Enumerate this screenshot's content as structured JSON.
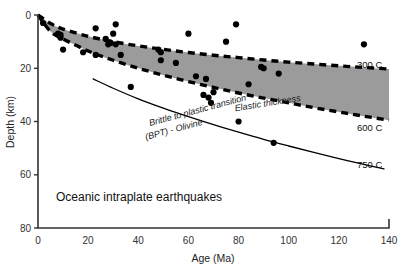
{
  "figure": {
    "caption": "Oceanic intraplate earthquakes",
    "background_color": "#ffffff",
    "band_color": "#9b9b9b",
    "axis_color": "#333333",
    "point_color": "#000000"
  },
  "axes": {
    "x_title": "Age (Ma)",
    "y_title": "Depth (km)",
    "x_ticks": [
      "0",
      "20",
      "40",
      "60",
      "80",
      "100",
      "120",
      "140"
    ],
    "y_ticks": [
      "0",
      "20",
      "40",
      "60",
      "80"
    ]
  },
  "labels": {
    "iso_300": "300 C",
    "iso_600": "600 C",
    "iso_750": "750 C",
    "band_label": "Elastic thickness",
    "bpt_line1": "Brittle to plastic transition",
    "bpt_line2": "(BPT) - Olivine"
  },
  "chart_data": {
    "type": "scatter",
    "title": "Oceanic intraplate earthquakes",
    "xlabel": "Age (Ma)",
    "ylabel": "Depth (km)",
    "xlim": [
      0,
      140
    ],
    "ylim": [
      0,
      80
    ],
    "y_inverted": true,
    "grid": false,
    "legend": "none",
    "x_ticks": [
      0,
      20,
      40,
      60,
      80,
      100,
      120,
      140
    ],
    "y_ticks": [
      0,
      20,
      40,
      60,
      80
    ],
    "points": [
      {
        "age": 2,
        "depth": 3
      },
      {
        "age": 8,
        "depth": 7
      },
      {
        "age": 9,
        "depth": 7.5
      },
      {
        "age": 9,
        "depth": 8.5
      },
      {
        "age": 10,
        "depth": 13
      },
      {
        "age": 18,
        "depth": 14
      },
      {
        "age": 23,
        "depth": 5
      },
      {
        "age": 23,
        "depth": 15
      },
      {
        "age": 27,
        "depth": 9
      },
      {
        "age": 28,
        "depth": 11
      },
      {
        "age": 29,
        "depth": 10.5
      },
      {
        "age": 30,
        "depth": 7
      },
      {
        "age": 31,
        "depth": 3.5
      },
      {
        "age": 31,
        "depth": 11
      },
      {
        "age": 33,
        "depth": 15
      },
      {
        "age": 37,
        "depth": 27
      },
      {
        "age": 48,
        "depth": 13
      },
      {
        "age": 49,
        "depth": 14
      },
      {
        "age": 49,
        "depth": 17
      },
      {
        "age": 55,
        "depth": 18
      },
      {
        "age": 60,
        "depth": 7
      },
      {
        "age": 63,
        "depth": 23
      },
      {
        "age": 66,
        "depth": 30
      },
      {
        "age": 67,
        "depth": 24
      },
      {
        "age": 68,
        "depth": 31
      },
      {
        "age": 69,
        "depth": 33
      },
      {
        "age": 70,
        "depth": 29
      },
      {
        "age": 75,
        "depth": 10
      },
      {
        "age": 79,
        "depth": 3.5
      },
      {
        "age": 80,
        "depth": 40
      },
      {
        "age": 84,
        "depth": 26
      },
      {
        "age": 89,
        "depth": 19.5
      },
      {
        "age": 90,
        "depth": 20
      },
      {
        "age": 94,
        "depth": 48
      },
      {
        "age": 96,
        "depth": 22
      },
      {
        "age": 130,
        "depth": 11
      }
    ],
    "curves": [
      {
        "name": "300 C",
        "style": "dashed",
        "points": [
          [
            0,
            0
          ],
          [
            5,
            3.2
          ],
          [
            10,
            5.3
          ],
          [
            20,
            8
          ],
          [
            30,
            10
          ],
          [
            40,
            11.6
          ],
          [
            50,
            12.9
          ],
          [
            60,
            14.1
          ],
          [
            70,
            15.1
          ],
          [
            80,
            16
          ],
          [
            90,
            16.9
          ],
          [
            100,
            17.7
          ],
          [
            110,
            18.4
          ],
          [
            120,
            19.1
          ],
          [
            130,
            19.7
          ],
          [
            140,
            20.3
          ]
        ]
      },
      {
        "name": "600 C",
        "style": "dashed",
        "points": [
          [
            0,
            0
          ],
          [
            5,
            6.2
          ],
          [
            10,
            9
          ],
          [
            20,
            13.5
          ],
          [
            30,
            17
          ],
          [
            40,
            20
          ],
          [
            50,
            22.6
          ],
          [
            60,
            25
          ],
          [
            70,
            27.2
          ],
          [
            80,
            29.3
          ],
          [
            90,
            31.2
          ],
          [
            100,
            33
          ],
          [
            110,
            34.8
          ],
          [
            120,
            36.4
          ],
          [
            130,
            38
          ],
          [
            140,
            39.5
          ]
        ]
      },
      {
        "name": "750 C",
        "style": "solid",
        "points": [
          [
            22,
            24
          ],
          [
            30,
            27.5
          ],
          [
            40,
            31.5
          ],
          [
            50,
            35
          ],
          [
            60,
            38.2
          ],
          [
            70,
            41.2
          ],
          [
            80,
            44
          ],
          [
            90,
            46.7
          ],
          [
            100,
            49.2
          ],
          [
            110,
            51.6
          ],
          [
            120,
            53.9
          ],
          [
            130,
            56.1
          ],
          [
            138,
            57.8
          ]
        ]
      }
    ],
    "shaded_band": {
      "label": "Elastic thickness",
      "upper_curve": "300 C",
      "lower_curve": "600 C",
      "color": "#9b9b9b"
    }
  }
}
